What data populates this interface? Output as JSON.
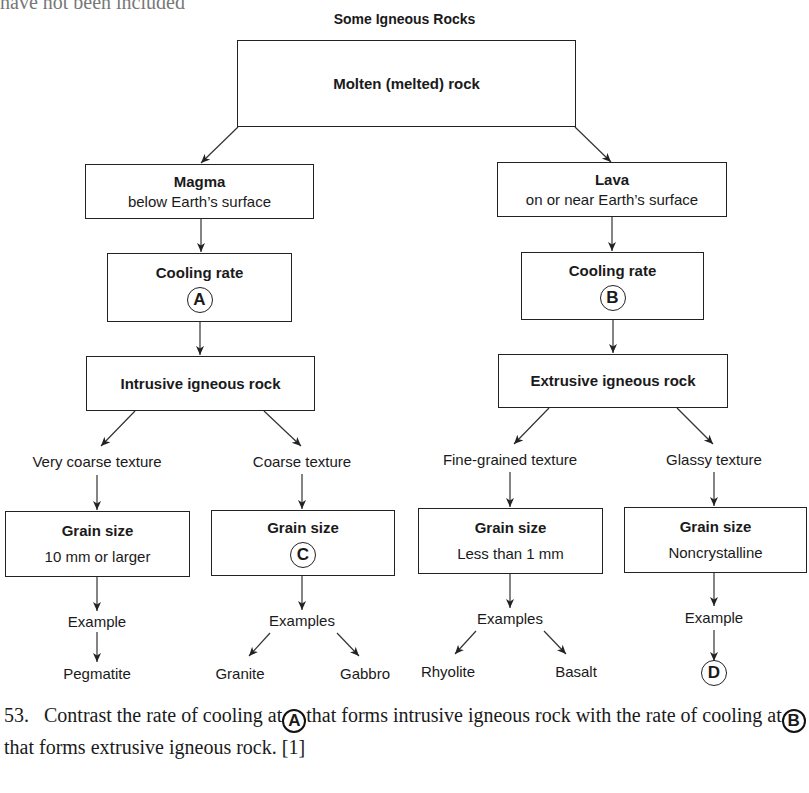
{
  "cut_off_text": "have not been included",
  "diagram": {
    "title": "Some Igneous Rocks",
    "top_box": {
      "label": "Molten (melted) rock"
    },
    "magma": {
      "title": "Magma",
      "subtitle": "below Earth’s surface"
    },
    "lava": {
      "title": "Lava",
      "subtitle": "on or near Earth’s surface"
    },
    "cooling_a": {
      "title": "Cooling rate",
      "marker": "A"
    },
    "cooling_b": {
      "title": "Cooling rate",
      "marker": "B"
    },
    "intrusive": {
      "label": "Intrusive igneous rock"
    },
    "extrusive": {
      "label": "Extrusive igneous rock"
    },
    "branches": [
      {
        "texture": "Very coarse texture",
        "grain_title": "Grain size",
        "grain_value": "10 mm or larger",
        "examples_label": "Example",
        "examples": [
          "Pegmatite"
        ]
      },
      {
        "texture": "Coarse texture",
        "grain_title": "Grain size",
        "grain_marker": "C",
        "examples_label": "Examples",
        "examples": [
          "Granite",
          "Gabbro"
        ]
      },
      {
        "texture": "Fine-grained texture",
        "grain_title": "Grain size",
        "grain_value": "Less than 1 mm",
        "examples_label": "Examples",
        "examples": [
          "Rhyolite",
          "Basalt"
        ]
      },
      {
        "texture": "Glassy texture",
        "grain_title": "Grain size",
        "grain_value": "Noncrystalline",
        "examples_label": "Example",
        "example_marker": "D"
      }
    ]
  },
  "question": {
    "number": "53.",
    "part1": "Contrast the rate of cooling at",
    "marker1": "A",
    "part2": "that forms intrusive igneous rock with the rate of cooling at",
    "marker2": "B",
    "part3": "that forms extrusive igneous rock. [1]"
  }
}
